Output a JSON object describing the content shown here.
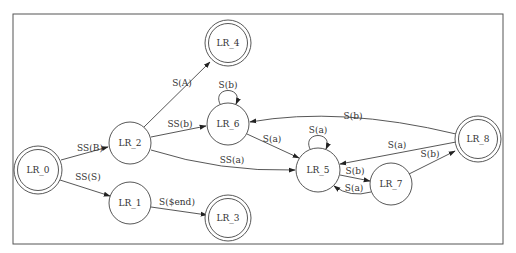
{
  "diagram": {
    "type": "state-machine",
    "nodes": [
      {
        "id": "LR_0",
        "label": "LR_0",
        "x": 38,
        "y": 170,
        "r": 21,
        "accepting": true
      },
      {
        "id": "LR_1",
        "label": "LR_1",
        "x": 130,
        "y": 203,
        "r": 21,
        "accepting": false
      },
      {
        "id": "LR_2",
        "label": "LR_2",
        "x": 130,
        "y": 143,
        "r": 21,
        "accepting": false
      },
      {
        "id": "LR_3",
        "label": "LR_3",
        "x": 228,
        "y": 218,
        "r": 20,
        "accepting": true
      },
      {
        "id": "LR_4",
        "label": "LR_4",
        "x": 228,
        "y": 43,
        "r": 20,
        "accepting": true
      },
      {
        "id": "LR_5",
        "label": "LR_5",
        "x": 318,
        "y": 170,
        "r": 22,
        "accepting": false
      },
      {
        "id": "LR_6",
        "label": "LR_6",
        "x": 228,
        "y": 124,
        "r": 21,
        "accepting": false
      },
      {
        "id": "LR_7",
        "label": "LR_7",
        "x": 391,
        "y": 184,
        "r": 21,
        "accepting": false
      },
      {
        "id": "LR_8",
        "label": "LR_8",
        "x": 478,
        "y": 139,
        "r": 20,
        "accepting": true
      }
    ],
    "edges": [
      {
        "from": "LR_0",
        "to": "LR_2",
        "label": "SS(B)"
      },
      {
        "from": "LR_0",
        "to": "LR_1",
        "label": "SS(S)"
      },
      {
        "from": "LR_2",
        "to": "LR_4",
        "label": "S(A)"
      },
      {
        "from": "LR_2",
        "to": "LR_6",
        "label": "SS(b)"
      },
      {
        "from": "LR_2",
        "to": "LR_5",
        "label": "SS(a)"
      },
      {
        "from": "LR_1",
        "to": "LR_3",
        "label": "S($end)"
      },
      {
        "from": "LR_6",
        "to": "LR_6",
        "label": "S(b)"
      },
      {
        "from": "LR_6",
        "to": "LR_5",
        "label": "S(a)"
      },
      {
        "from": "LR_5",
        "to": "LR_5",
        "label": "S(a)"
      },
      {
        "from": "LR_5",
        "to": "LR_7",
        "label": "S(b)"
      },
      {
        "from": "LR_7",
        "to": "LR_5",
        "label": "S(a)"
      },
      {
        "from": "LR_7",
        "to": "LR_8",
        "label": "S(b)"
      },
      {
        "from": "LR_8",
        "to": "LR_5",
        "label": "S(a)"
      },
      {
        "from": "LR_8",
        "to": "LR_6",
        "label": "S(b)"
      }
    ]
  },
  "labels": {
    "LR_0": "LR_0",
    "LR_1": "LR_1",
    "LR_2": "LR_2",
    "LR_3": "LR_3",
    "LR_4": "LR_4",
    "LR_5": "LR_5",
    "LR_6": "LR_6",
    "LR_7": "LR_7",
    "LR_8": "LR_8",
    "e_0_2": "SS(B)",
    "e_0_1": "SS(S)",
    "e_2_4": "S(A)",
    "e_2_6": "SS(b)",
    "e_2_5": "SS(a)",
    "e_1_3": "S($end)",
    "e_6_6": "S(b)",
    "e_6_5": "S(a)",
    "e_5_5": "S(a)",
    "e_5_7": "S(b)",
    "e_7_5": "S(a)",
    "e_7_8": "S(b)",
    "e_8_5": "S(a)",
    "e_8_6": "S(b)"
  }
}
